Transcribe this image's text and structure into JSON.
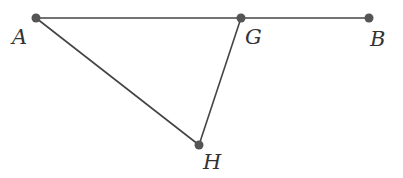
{
  "diagram": {
    "points": [
      {
        "id": "A",
        "label": "A",
        "x": 36,
        "y": 18,
        "lx": 12,
        "ly": 44
      },
      {
        "id": "G",
        "label": "G",
        "x": 241,
        "y": 18,
        "lx": 245,
        "ly": 44
      },
      {
        "id": "B",
        "label": "B",
        "x": 369,
        "y": 18,
        "lx": 370,
        "ly": 46
      },
      {
        "id": "H",
        "label": "H",
        "x": 199,
        "y": 145,
        "lx": 203,
        "ly": 169
      }
    ],
    "segments": [
      [
        "A",
        "B"
      ],
      [
        "A",
        "H"
      ],
      [
        "G",
        "H"
      ]
    ],
    "colors": {
      "line": "#444444",
      "point": "#555555",
      "label": "#333333"
    }
  }
}
